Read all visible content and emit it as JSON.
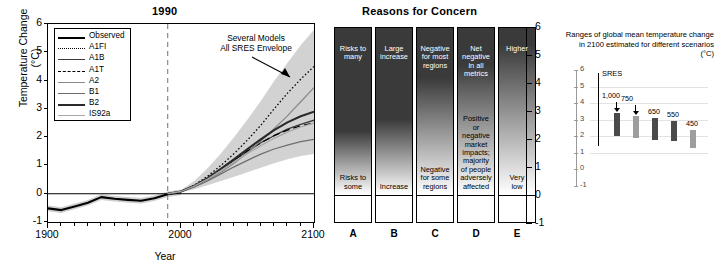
{
  "left_panel": {
    "title": "1990",
    "ylabel": "Temperature Change (°C)",
    "xlabel": "Year",
    "yticks": [
      "6",
      "5",
      "4",
      "3",
      "2",
      "1",
      "0",
      "-1"
    ],
    "xticks": [
      "1900",
      "2000",
      "2100"
    ],
    "annotation_line1": "Several Models",
    "annotation_line2": "All SRES Envelope",
    "legend": [
      {
        "label": "Observed",
        "style": "solid-thick",
        "color": "#000000"
      },
      {
        "label": "A1FI",
        "style": "dotted",
        "color": "#000000"
      },
      {
        "label": "A1B",
        "style": "solid",
        "color": "#3a3a3a"
      },
      {
        "label": "A1T",
        "style": "dashed",
        "color": "#000000"
      },
      {
        "label": "A2",
        "style": "solid",
        "color": "#8a8a8a"
      },
      {
        "label": "B1",
        "style": "solid",
        "color": "#6e6e6e"
      },
      {
        "label": "B2",
        "style": "solid-thick",
        "color": "#2a2a2a"
      },
      {
        "label": "IS92a",
        "style": "solid",
        "color": "#a8a8a8"
      }
    ]
  },
  "chart_data": {
    "type": "line",
    "title": "1990",
    "xlabel": "Year",
    "ylabel": "Temperature Change (°C)",
    "xlim": [
      1900,
      2100
    ],
    "ylim": [
      -1,
      6
    ],
    "grid": false,
    "legend_position": "top-left",
    "reference_year": 1990,
    "annotations": [
      "Several Models",
      "All SRES Envelope"
    ],
    "x": [
      1900,
      1910,
      1920,
      1930,
      1940,
      1950,
      1960,
      1970,
      1980,
      1990,
      2000,
      2010,
      2020,
      2030,
      2040,
      2050,
      2060,
      2070,
      2080,
      2090,
      2100
    ],
    "series": [
      {
        "name": "Observed",
        "values": [
          -0.52,
          -0.58,
          -0.45,
          -0.32,
          -0.12,
          -0.18,
          -0.22,
          -0.25,
          -0.16,
          -0.02,
          0.05,
          null,
          null,
          null,
          null,
          null,
          null,
          null,
          null,
          null,
          null
        ]
      },
      {
        "name": "A1FI",
        "values": [
          null,
          null,
          null,
          null,
          null,
          null,
          null,
          null,
          null,
          0.0,
          0.08,
          0.3,
          0.62,
          1.0,
          1.42,
          1.9,
          2.42,
          3.0,
          3.55,
          4.05,
          4.5
        ]
      },
      {
        "name": "A1B",
        "values": [
          null,
          null,
          null,
          null,
          null,
          null,
          null,
          null,
          null,
          0.0,
          0.08,
          0.28,
          0.55,
          0.86,
          1.18,
          1.5,
          1.8,
          2.05,
          2.28,
          2.45,
          2.6
        ]
      },
      {
        "name": "A1T",
        "values": [
          null,
          null,
          null,
          null,
          null,
          null,
          null,
          null,
          null,
          0.0,
          0.08,
          0.28,
          0.56,
          0.88,
          1.2,
          1.52,
          1.8,
          2.05,
          2.25,
          2.4,
          2.5
        ]
      },
      {
        "name": "A2",
        "values": [
          null,
          null,
          null,
          null,
          null,
          null,
          null,
          null,
          null,
          0.0,
          0.07,
          0.25,
          0.48,
          0.76,
          1.08,
          1.45,
          1.86,
          2.3,
          2.75,
          3.25,
          3.75
        ]
      },
      {
        "name": "B1",
        "values": [
          null,
          null,
          null,
          null,
          null,
          null,
          null,
          null,
          null,
          0.0,
          0.07,
          0.24,
          0.45,
          0.7,
          0.95,
          1.18,
          1.4,
          1.58,
          1.72,
          1.84,
          1.92
        ]
      },
      {
        "name": "B2",
        "values": [
          null,
          null,
          null,
          null,
          null,
          null,
          null,
          null,
          null,
          0.0,
          0.08,
          0.28,
          0.55,
          0.88,
          1.22,
          1.58,
          1.92,
          2.25,
          2.52,
          2.74,
          2.9
        ]
      },
      {
        "name": "IS92a",
        "values": [
          null,
          null,
          null,
          null,
          null,
          null,
          null,
          null,
          null,
          0.0,
          0.08,
          0.27,
          0.52,
          0.82,
          1.12,
          1.42,
          1.7,
          1.96,
          2.18,
          2.36,
          2.5
        ]
      }
    ],
    "envelope": {
      "name": "All SRES Envelope",
      "upper": [
        null,
        null,
        null,
        null,
        null,
        null,
        null,
        null,
        null,
        0.0,
        0.13,
        0.45,
        0.9,
        1.42,
        2.0,
        2.62,
        3.28,
        3.98,
        4.62,
        5.25,
        5.8
      ],
      "lower": [
        null,
        null,
        null,
        null,
        null,
        null,
        null,
        null,
        null,
        0.0,
        0.05,
        0.16,
        0.3,
        0.45,
        0.6,
        0.76,
        0.92,
        1.08,
        1.22,
        1.33,
        1.4
      ]
    }
  },
  "embers_panel": {
    "title": "Reasons for Concern",
    "yticks": [
      "6",
      "5",
      "4",
      "3",
      "2",
      "1",
      "0",
      "-1"
    ],
    "columns": [
      {
        "letter": "A",
        "top_text": "Risks to\nmany",
        "bottom_text": "Risks to\nsome",
        "fade_start": 0.62
      },
      {
        "letter": "B",
        "top_text": "Large\nincrease",
        "bottom_text": "Increase",
        "fade_start": 0.55
      },
      {
        "letter": "C",
        "top_text": "Negative\nfor most\nregions",
        "bottom_text": "Negative\nfor some\nregions",
        "fade_start": 0.3
      },
      {
        "letter": "D",
        "top_text": "Net\nnegative\nin all\nmetrics",
        "bottom_text": "Positive\nor\nnegative\nmarket\nimpacts;\nmajority\nof people\nadversely\naffected",
        "fade_start": 0.22
      },
      {
        "letter": "E",
        "top_text": "Higher",
        "bottom_text": "Very\nlow",
        "fade_start": 0.1
      }
    ]
  },
  "scenario_panel": {
    "caption": "Ranges of global mean temperature change in 2100 estimated for different scenarios (°C)",
    "axis_ticks": [
      "6",
      "5",
      "4",
      "3",
      "2",
      "1",
      "0",
      "-1"
    ],
    "sres_label": "SRES",
    "sres_range": [
      1.4,
      5.8
    ],
    "bars": [
      {
        "label": "1,000",
        "low": 2.0,
        "high": 3.4,
        "shade": "dark",
        "has_arrow": true
      },
      {
        "label": "750",
        "low": 1.9,
        "high": 3.2,
        "shade": "light",
        "has_arrow": true
      },
      {
        "label": "650",
        "low": 1.8,
        "high": 3.1,
        "shade": "dark",
        "has_arrow": false
      },
      {
        "label": "550",
        "low": 1.7,
        "high": 2.9,
        "shade": "dark",
        "has_arrow": false
      },
      {
        "label": "450",
        "low": 1.3,
        "high": 2.4,
        "shade": "light",
        "has_arrow": false
      }
    ]
  }
}
